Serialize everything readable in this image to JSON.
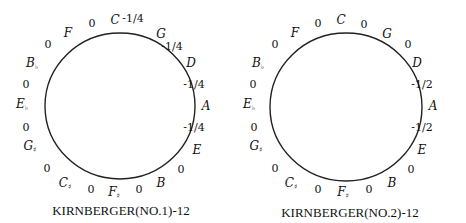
{
  "diagrams": [
    {
      "caption": "KIRNBERGER(NO.1)-12",
      "center": [
        120,
        106
      ],
      "radius": [
        75,
        73
      ],
      "notes": [
        {
          "name": "C",
          "acc": "",
          "x": 115,
          "y": 24
        },
        {
          "name": "G",
          "acc": "",
          "x": 161,
          "y": 38
        },
        {
          "name": "D",
          "acc": "",
          "x": 191,
          "y": 67
        },
        {
          "name": "A",
          "acc": "",
          "x": 206,
          "y": 110
        },
        {
          "name": "E",
          "acc": "",
          "x": 197,
          "y": 154
        },
        {
          "name": "B",
          "acc": "",
          "x": 161,
          "y": 187
        },
        {
          "name": "F",
          "acc": "♯",
          "x": 114,
          "y": 196
        },
        {
          "name": "C",
          "acc": "♯",
          "x": 65,
          "y": 187
        },
        {
          "name": "G",
          "acc": "♯",
          "x": 30,
          "y": 150
        },
        {
          "name": "E",
          "acc": "♭",
          "x": 22,
          "y": 108
        },
        {
          "name": "B",
          "acc": "♭",
          "x": 32,
          "y": 67
        },
        {
          "name": "F",
          "acc": "",
          "x": 68,
          "y": 37
        }
      ],
      "values": [
        {
          "label": "-1/4",
          "x": 133,
          "y": 22
        },
        {
          "label": "-1/4",
          "x": 172,
          "y": 50
        },
        {
          "label": "-1/4",
          "x": 194,
          "y": 88
        },
        {
          "label": "-1/4",
          "x": 194,
          "y": 131
        },
        {
          "label": "0",
          "x": 181,
          "y": 173
        },
        {
          "label": "0",
          "x": 139,
          "y": 193
        },
        {
          "label": "0",
          "x": 91,
          "y": 193
        },
        {
          "label": "0",
          "x": 47,
          "y": 172
        },
        {
          "label": "0",
          "x": 26,
          "y": 131
        },
        {
          "label": "0",
          "x": 26,
          "y": 88
        },
        {
          "label": "0",
          "x": 48,
          "y": 48
        },
        {
          "label": "0",
          "x": 92,
          "y": 27
        }
      ]
    },
    {
      "caption": "KIRNBERGER(NO.2)-12",
      "center": [
        346,
        107
      ],
      "radius": [
        76,
        74
      ],
      "notes": [
        {
          "name": "C",
          "acc": "",
          "x": 341,
          "y": 24
        },
        {
          "name": "G",
          "acc": "",
          "x": 387,
          "y": 38
        },
        {
          "name": "D",
          "acc": "",
          "x": 417,
          "y": 67
        },
        {
          "name": "A",
          "acc": "",
          "x": 433,
          "y": 110
        },
        {
          "name": "E",
          "acc": "",
          "x": 422,
          "y": 154
        },
        {
          "name": "B",
          "acc": "",
          "x": 392,
          "y": 187
        },
        {
          "name": "F",
          "acc": "♯",
          "x": 343,
          "y": 196
        },
        {
          "name": "C",
          "acc": "♯",
          "x": 291,
          "y": 187
        },
        {
          "name": "G",
          "acc": "♯",
          "x": 256,
          "y": 150
        },
        {
          "name": "E",
          "acc": "♭",
          "x": 249,
          "y": 108
        },
        {
          "name": "B",
          "acc": "♭",
          "x": 258,
          "y": 67
        },
        {
          "name": "F",
          "acc": "",
          "x": 295,
          "y": 37
        }
      ],
      "values": [
        {
          "label": "0",
          "x": 364,
          "y": 28
        },
        {
          "label": "0",
          "x": 408,
          "y": 48
        },
        {
          "label": "-1/2",
          "x": 422,
          "y": 88
        },
        {
          "label": "-1/2",
          "x": 422,
          "y": 131
        },
        {
          "label": "0",
          "x": 411,
          "y": 173
        },
        {
          "label": "0",
          "x": 369,
          "y": 193
        },
        {
          "label": "0",
          "x": 318,
          "y": 193
        },
        {
          "label": "0",
          "x": 275,
          "y": 172
        },
        {
          "label": "0",
          "x": 254,
          "y": 131
        },
        {
          "label": "0",
          "x": 253,
          "y": 88
        },
        {
          "label": "0",
          "x": 275,
          "y": 48
        },
        {
          "label": "0",
          "x": 318,
          "y": 27
        }
      ]
    }
  ],
  "caption_positions": [
    [
      121,
      215
    ],
    [
      350,
      217
    ]
  ]
}
